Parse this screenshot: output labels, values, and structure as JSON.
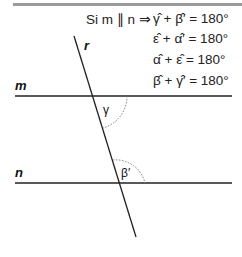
{
  "premise": "Si m ∥ n ⇒",
  "equations": [
    "γ̂ + β̂′ = 180°",
    "ε̂ + α̂′ = 180°",
    "α̂ + ε̂ = 180°",
    "β̂ + γ̂′ = 180°"
  ],
  "lines": {
    "m": "m",
    "n": "n",
    "r": "r"
  },
  "angles": {
    "gamma": "γ",
    "beta_prime": "β′"
  },
  "colors": {
    "line": "#222222",
    "bar": "#999999",
    "arc": "#777777"
  }
}
